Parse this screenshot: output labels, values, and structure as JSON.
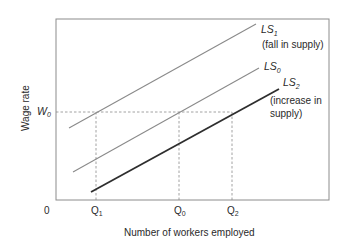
{
  "diagram": {
    "type": "labour-supply-shifts",
    "axes": {
      "x_label": "Number of workers employed",
      "y_label": "Wage rate",
      "origin_label": "0"
    },
    "wage_level": {
      "label": "W",
      "sub": "0"
    },
    "quantities": [
      {
        "id": "q1",
        "label": "Q",
        "sub": "1"
      },
      {
        "id": "q0",
        "label": "Q",
        "sub": "0"
      },
      {
        "id": "q2",
        "label": "Q",
        "sub": "2"
      }
    ],
    "curves": [
      {
        "id": "ls1",
        "label": "LS",
        "sub": "1",
        "note": "(fall in supply)",
        "color": "#8a8a8a"
      },
      {
        "id": "ls0",
        "label": "LS",
        "sub": "0",
        "note": "",
        "color": "#8a8a8a"
      },
      {
        "id": "ls2",
        "label": "LS",
        "sub": "2",
        "note_line1": "(increase in",
        "note_line2": "supply)",
        "color": "#2e2e2e"
      }
    ],
    "frame_color": "#8c8c8c",
    "guide_color": "#8c8c8c"
  }
}
